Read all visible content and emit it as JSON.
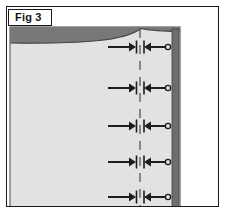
{
  "figure": {
    "label": "Fig 3",
    "caption_box_visible": true
  },
  "colors": {
    "page_background": "#ffffff",
    "frame_stroke": "#1a1a1a",
    "panel_fill": "#e2e2e2",
    "panel_edge_stroke": "#8c8c8c",
    "band_dark_fill": "#787878",
    "band_dark_stroke": "#3f3f3f",
    "edge_strip_fill": "#6e6e6e",
    "marker_stroke": "#1d1d1d",
    "dash_line_stroke": "#555555",
    "circle_fill": "#e2e2e2"
  },
  "geometry": {
    "canvas_width": 226,
    "canvas_height": 211,
    "outer_frame": {
      "x": 6,
      "y": 6,
      "width": 213,
      "height": 201
    },
    "panel": {
      "x": 10,
      "y": 27,
      "width": 170,
      "height": 184
    },
    "dark_band_top": {
      "x": 10,
      "y": 27,
      "width": 170,
      "height": 16
    },
    "right_edge_strip": {
      "x": 172,
      "y": 27,
      "width": 7,
      "height": 184
    },
    "centerline_x": 140
  },
  "diagram": {
    "type": "technical-cross-section",
    "centerline": {
      "name": "vertical-dashed-centerline",
      "x": 140,
      "y_start": 29,
      "y_end": 211,
      "dash_pattern": "9 7"
    },
    "top_band_peak_x": 141,
    "marker_rows": [
      {
        "index": 1,
        "y": 47,
        "left_arrow_start_x": 108,
        "left_arrow_end_x": 136,
        "right_arrow_start_x": 144,
        "right_arrow_end_x": 168,
        "circle_x": 168,
        "circle_r": 2.6,
        "tick_height": 13
      },
      {
        "index": 2,
        "y": 88,
        "left_arrow_start_x": 108,
        "left_arrow_end_x": 136,
        "right_arrow_start_x": 144,
        "right_arrow_end_x": 168,
        "circle_x": 168,
        "circle_r": 2.6,
        "tick_height": 13
      },
      {
        "index": 3,
        "y": 126,
        "left_arrow_start_x": 108,
        "left_arrow_end_x": 136,
        "right_arrow_start_x": 144,
        "right_arrow_end_x": 168,
        "circle_x": 168,
        "circle_r": 2.6,
        "tick_height": 13
      },
      {
        "index": 4,
        "y": 162,
        "left_arrow_start_x": 108,
        "left_arrow_end_x": 136,
        "right_arrow_start_x": 144,
        "right_arrow_end_x": 168,
        "circle_x": 168,
        "circle_r": 2.6,
        "tick_height": 13
      },
      {
        "index": 5,
        "y": 197,
        "left_arrow_start_x": 108,
        "left_arrow_end_x": 136,
        "right_arrow_start_x": 144,
        "right_arrow_end_x": 168,
        "circle_x": 168,
        "circle_r": 2.6,
        "tick_height": 13
      }
    ],
    "marker_semantics": {
      "left_element": "right-pointing-arrow-to-tick",
      "right_element": "left-pointing-arrow-from-tick-with-end-circle"
    }
  }
}
